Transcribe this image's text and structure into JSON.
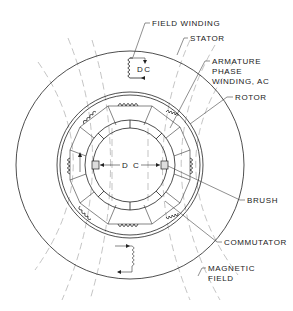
{
  "diagram": {
    "labels": {
      "field_winding": "FIELD  WINDING",
      "stator": "STATOR",
      "armature_1": "ARMATURE",
      "armature_2": "PHASE",
      "armature_3": "WINDING, AC",
      "rotor": "ROTOR",
      "brush": "BRUSH",
      "commutator": "COMMUTATOR",
      "magnetic_1": "MAGNETIC",
      "magnetic_2": "FIELD"
    },
    "field_dc_label": "DC",
    "brush_dc_label": "D C",
    "colors": {
      "ink": "#222222",
      "field_lines": "#aaaaaa",
      "background": "#ffffff"
    }
  }
}
